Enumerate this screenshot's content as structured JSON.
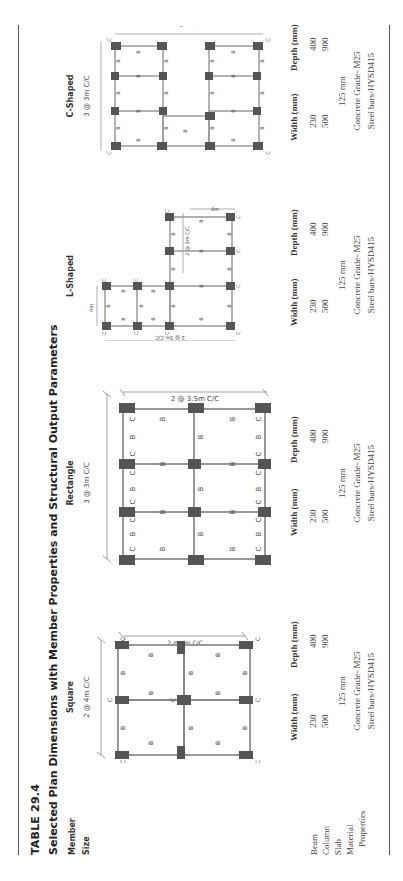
{
  "table": {
    "number": "TABLE 29.4",
    "title": "Selected Plan Dimensions with Member Properties and Structural Output Parameters",
    "row_header": [
      "Member",
      "Size"
    ],
    "rows": [
      "Beam",
      "Column",
      "Slab",
      "Material",
      "Properties"
    ],
    "columns": [
      {
        "name": "Square",
        "dim_top": "2 @ 4m C/C",
        "dim_side": "2 @ 4m C/C",
        "width_label": "Width (mm)",
        "depth_label": "Depth (mm)",
        "beam": {
          "width": "230",
          "depth": "400"
        },
        "column": {
          "width": "500",
          "depth": "900"
        },
        "slab": "125 mm",
        "material": "Concrete Grade- M25",
        "properties": "Steel bars-HYSD415"
      },
      {
        "name": "Rectangle",
        "dim_top": "3 @ 3m C/C",
        "dim_side": "2 @ 3.5m C/C",
        "width_label": "Width (mm)",
        "depth_label": "Depth (mm)",
        "beam": {
          "width": "230",
          "depth": "400"
        },
        "column": {
          "width": "500",
          "depth": "900"
        },
        "slab": "125 mm",
        "material": "Concrete Grade- M25",
        "properties": "Steel bars-HYSD415"
      },
      {
        "name": "L-Shaped",
        "dim_a": "4m",
        "dim_b": "2 @ 3m C/C",
        "dim_c": "4m",
        "dim_d": "2 @ 3m C/C",
        "width_label": "Width (mm)",
        "depth_label": "Depth (mm)",
        "beam": {
          "width": "230",
          "depth": "400"
        },
        "column": {
          "width": "500",
          "depth": "900"
        },
        "slab": "125 mm",
        "material": "Concrete Grade- M25",
        "properties": "Steel bars-HYSD415"
      },
      {
        "name": "C-Shaped",
        "dim_top": "3 @ 3m C/C",
        "dim_bottom": "3 @ 3m C/C",
        "width_label": "Width (mm)",
        "depth_label": "Depth (mm)",
        "beam": {
          "width": "230",
          "depth": "400"
        },
        "column": {
          "width": "500",
          "depth": "900"
        },
        "slab": "125 mm",
        "material": "Concrete Grade- M25",
        "properties": "Steel bars-HYSD415"
      }
    ],
    "plan_labels": {
      "column": "C",
      "beam": "B"
    }
  }
}
